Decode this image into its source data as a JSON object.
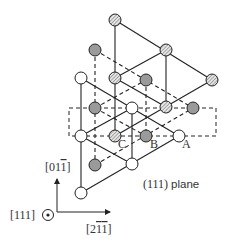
{
  "diagram": {
    "colors": {
      "line": "#222222",
      "atom_white": "#ffffff",
      "atom_gray": "#9a9a9a",
      "atom_hatched_bg": "#e0e0e0",
      "text": "#333333"
    },
    "layers": [
      {
        "name": "A",
        "style": "white",
        "line": "solid",
        "atoms": [
          [
            81,
            78
          ],
          [
            132,
            108
          ],
          [
            81,
            136
          ],
          [
            179,
            136
          ],
          [
            132,
            164
          ],
          [
            81,
            193
          ]
        ],
        "edges": [
          [
            0,
            5
          ],
          [
            0,
            3
          ],
          [
            5,
            3
          ],
          [
            2,
            1
          ],
          [
            2,
            4
          ],
          [
            1,
            4
          ]
        ]
      },
      {
        "name": "B",
        "style": "gray",
        "line": "dashed",
        "atoms": [
          [
            95,
            50
          ],
          [
            146,
            80
          ],
          [
            95,
            108
          ],
          [
            193,
            108
          ],
          [
            146,
            136
          ],
          [
            95,
            165
          ]
        ],
        "edges": [
          [
            0,
            5
          ],
          [
            0,
            3
          ],
          [
            5,
            3
          ],
          [
            2,
            1
          ],
          [
            2,
            4
          ],
          [
            1,
            4
          ]
        ]
      },
      {
        "name": "C",
        "style": "hatched",
        "line": "solid",
        "atoms": [
          [
            115,
            20
          ],
          [
            166,
            50
          ],
          [
            212,
            80
          ],
          [
            115,
            78
          ],
          [
            166,
            107
          ],
          [
            115,
            136
          ]
        ],
        "edges": [
          [
            0,
            5
          ],
          [
            0,
            2
          ],
          [
            5,
            2
          ],
          [
            3,
            1
          ],
          [
            3,
            4
          ],
          [
            1,
            4
          ]
        ]
      }
    ],
    "plane_rect": {
      "x": 69,
      "y": 108,
      "width": 147,
      "height": 28
    },
    "site_labels": [
      {
        "text": "A",
        "x": 182,
        "y": 147
      },
      {
        "text": "B",
        "x": 150,
        "y": 147
      },
      {
        "text": "C",
        "x": 118,
        "y": 147
      }
    ],
    "plane_label": "(111) plane",
    "axes": {
      "origin": [
        57,
        212
      ],
      "vertical_label": "[011̄]",
      "horizontal_label": "[21̄1̄]",
      "out_of_page_label": "[111]"
    }
  }
}
